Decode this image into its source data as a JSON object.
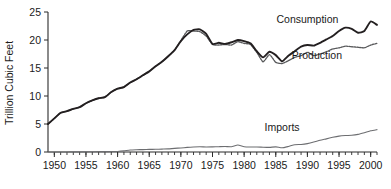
{
  "chart_data": {
    "type": "line",
    "title": "",
    "subtitle": "",
    "xlabel": "",
    "ylabel": "Trillion Cubic Feet",
    "xlim": [
      1949,
      2001
    ],
    "ylim": [
      0,
      25
    ],
    "grid": false,
    "legend_position": "inline-annotations",
    "x_tick_labels": [
      "1950",
      "1955",
      "1960",
      "1965",
      "1970",
      "1975",
      "1980",
      "1985",
      "1990",
      "1995",
      "2000"
    ],
    "x_tick_values": [
      1950,
      1955,
      1960,
      1965,
      1970,
      1975,
      1980,
      1985,
      1990,
      1995,
      2000
    ],
    "x_minor_tick_interval": 1,
    "y_tick_labels": [
      "0",
      "5",
      "10",
      "15",
      "20",
      "25"
    ],
    "y_tick_values": [
      0,
      5,
      10,
      15,
      20,
      25
    ],
    "x": [
      1949,
      1950,
      1951,
      1952,
      1953,
      1954,
      1955,
      1956,
      1957,
      1958,
      1959,
      1960,
      1961,
      1962,
      1963,
      1964,
      1965,
      1966,
      1967,
      1968,
      1969,
      1970,
      1971,
      1972,
      1973,
      1974,
      1975,
      1976,
      1977,
      1978,
      1979,
      1980,
      1981,
      1982,
      1983,
      1984,
      1985,
      1986,
      1987,
      1988,
      1989,
      1990,
      1991,
      1992,
      1993,
      1994,
      1995,
      1996,
      1997,
      1998,
      1999,
      2000,
      2001
    ],
    "series": [
      {
        "name": "Consumption",
        "style": "solid-thick",
        "color": "#231f20",
        "label_x": 1990.0,
        "label_y": 23.6,
        "values": [
          5.0,
          6.0,
          7.0,
          7.3,
          7.7,
          8.0,
          8.7,
          9.2,
          9.6,
          9.8,
          10.7,
          11.3,
          11.6,
          12.4,
          13.0,
          13.7,
          14.4,
          15.3,
          16.1,
          17.1,
          18.2,
          19.8,
          21.0,
          21.8,
          21.9,
          21.1,
          19.3,
          19.5,
          19.3,
          19.6,
          20.0,
          19.8,
          19.4,
          18.0,
          16.9,
          17.9,
          17.3,
          16.2,
          17.2,
          18.0,
          18.8,
          19.1,
          19.0,
          19.5,
          20.1,
          20.7,
          21.6,
          22.2,
          22.0,
          21.3,
          21.6,
          23.3,
          22.7
        ]
      },
      {
        "name": "Production",
        "style": "dotted",
        "color": "#58595b",
        "label_x": 1991.5,
        "label_y": 17.2,
        "values": [
          5.0,
          6.0,
          7.0,
          7.3,
          7.7,
          8.0,
          8.7,
          9.2,
          9.6,
          9.8,
          10.7,
          11.3,
          11.6,
          12.4,
          13.0,
          13.7,
          14.4,
          15.3,
          16.1,
          17.1,
          18.2,
          19.9,
          21.6,
          21.6,
          21.5,
          20.7,
          19.2,
          19.1,
          19.2,
          19.1,
          19.7,
          19.4,
          19.2,
          17.8,
          16.1,
          17.4,
          16.0,
          15.8,
          16.3,
          16.9,
          17.2,
          17.8,
          17.2,
          17.5,
          17.9,
          18.4,
          18.6,
          18.9,
          18.8,
          18.7,
          18.6,
          19.1,
          19.4
        ]
      },
      {
        "name": "Imports",
        "style": "solid-thin",
        "color": "#6d6e71",
        "label_x": 1986.0,
        "label_y": 4.4,
        "values": [
          0.0,
          0.0,
          0.0,
          0.01,
          0.02,
          0.02,
          0.03,
          0.04,
          0.06,
          0.07,
          0.08,
          0.1,
          0.2,
          0.35,
          0.4,
          0.43,
          0.46,
          0.48,
          0.52,
          0.56,
          0.65,
          0.72,
          0.82,
          0.9,
          0.95,
          0.9,
          0.92,
          0.95,
          0.98,
          0.95,
          1.25,
          0.95,
          0.9,
          0.9,
          0.85,
          0.82,
          0.92,
          0.75,
          0.99,
          1.3,
          1.35,
          1.5,
          1.77,
          2.1,
          2.35,
          2.62,
          2.84,
          2.94,
          2.99,
          3.15,
          3.44,
          3.78,
          4.0
        ]
      }
    ]
  }
}
